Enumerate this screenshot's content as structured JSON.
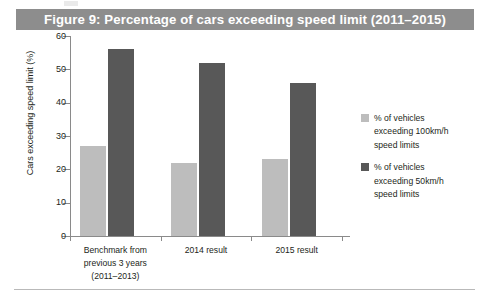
{
  "figure": {
    "title": "Figure 9: Percentage of cars exceeding speed limit (2011–2015)",
    "title_bar_color": "#8d8d8d",
    "title_text_color": "#ffffff"
  },
  "axes": {
    "y_title": "Cars exceeding speed limit (%)",
    "y_ticks": [
      "60",
      "50",
      "40",
      "30",
      "20",
      "10",
      "0"
    ],
    "x_categories": [
      {
        "line1": "Benchmark from",
        "line2": "previous 3 years",
        "line3": "(2011–2013)"
      },
      {
        "line1": "2014 result",
        "line2": "",
        "line3": ""
      },
      {
        "line1": "2015 result",
        "line2": "",
        "line3": ""
      }
    ]
  },
  "legend": {
    "items": [
      {
        "color": "#bdbdbd",
        "line1": "% of vehicles",
        "line2": "exceeding 100km/h",
        "line3": "speed limits"
      },
      {
        "color": "#585858",
        "line1": "% of vehicles",
        "line2": "exceeding 50km/h",
        "line3": "speed limits"
      }
    ]
  },
  "chart_data": {
    "type": "bar",
    "title": "Figure 9: Percentage of cars exceeding speed limit (2011–2015)",
    "xlabel": "",
    "ylabel": "Cars exceeding speed limit (%)",
    "ylim": [
      0,
      60
    ],
    "ytick_step": 10,
    "grid": false,
    "legend_position": "right",
    "categories": [
      "Benchmark from previous 3 years (2011–2013)",
      "2014 result",
      "2015 result"
    ],
    "series": [
      {
        "name": "% of vehicles exceeding 100km/h speed limits",
        "color": "#bdbdbd",
        "values": [
          27,
          22,
          23
        ]
      },
      {
        "name": "% of vehicles exceeding 50km/h speed limits",
        "color": "#585858",
        "values": [
          56,
          52,
          46
        ]
      }
    ]
  }
}
